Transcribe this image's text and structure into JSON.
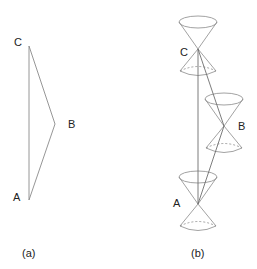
{
  "panel_a": {
    "caption": "(a)",
    "labels": {
      "A": "A",
      "B": "B",
      "C": "C"
    },
    "points": {
      "A": [
        29,
        200
      ],
      "B": [
        55,
        124
      ],
      "C": [
        29,
        46
      ]
    }
  },
  "panel_b": {
    "caption": "(b)",
    "labels": {
      "A": "A",
      "B": "B",
      "C": "C"
    },
    "cones": [
      {
        "event": "C",
        "apex": [
          198,
          49
        ]
      },
      {
        "event": "B",
        "apex": [
          224,
          126
        ]
      },
      {
        "event": "A",
        "apex": [
          198,
          204
        ]
      }
    ]
  },
  "colors": {
    "line": "#8a8a8a",
    "text": "#222222"
  }
}
